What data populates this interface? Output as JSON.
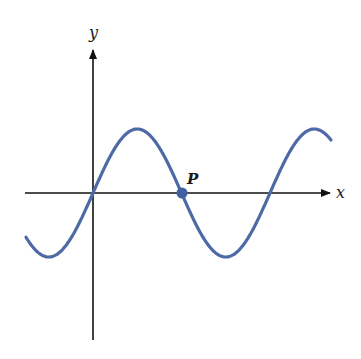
{
  "labels": {
    "x_axis": "x",
    "y_axis": "y",
    "point": "P"
  },
  "colors": {
    "curve": "#4d6aa6",
    "point": "#3f60a3",
    "axes": "#111111"
  },
  "chart_data": {
    "type": "line",
    "function": "sine",
    "xlabel": "x",
    "ylabel": "y",
    "annotations": [
      {
        "label": "P",
        "x": 3.1416,
        "y": 0
      }
    ],
    "x_range": [
      -2.2,
      7.1
    ],
    "y_range": [
      -1,
      1
    ],
    "grid": false
  }
}
